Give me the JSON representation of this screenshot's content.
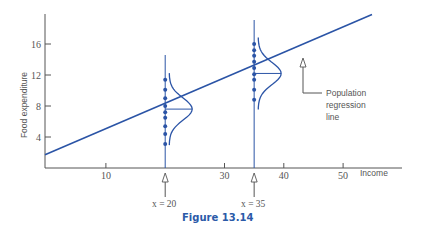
{
  "chart_data": {
    "type": "scatter",
    "title": "",
    "caption": "Figure 13.14",
    "xlabel": "Income",
    "ylabel": "Food expenditure",
    "xlim": [
      0,
      55
    ],
    "ylim": [
      0,
      18
    ],
    "x_ticks": [
      10,
      30,
      40,
      50
    ],
    "y_ticks": [
      4,
      8,
      12,
      16
    ],
    "grid": false,
    "regression_line": {
      "intercept": 1.7,
      "slope": 0.33,
      "x_range": [
        0,
        55
      ],
      "label": "Population regression line"
    },
    "series": [
      {
        "name": "x = 20",
        "x": 20,
        "y": [
          11.4,
          10.1,
          9.0,
          8.0,
          7.2,
          6.5,
          5.4,
          4.4,
          3.1
        ],
        "mean": 7.6
      },
      {
        "name": "x = 35",
        "x": 35,
        "y": [
          16.0,
          15.2,
          14.5,
          13.7,
          12.9,
          12.1,
          11.4,
          10.1,
          8.8
        ],
        "mean": 12.2
      }
    ],
    "annotations": [
      {
        "text": "Population regression line",
        "points_to": [
          43,
          15.7
        ]
      },
      {
        "text": "x = 20",
        "points_to": [
          20,
          0
        ]
      },
      {
        "text": "x = 35",
        "points_to": [
          35,
          0
        ]
      }
    ]
  },
  "labels": {
    "ylabel": "Food expenditure",
    "xlabel": "Income",
    "annot_line1": "Population",
    "annot_line2": "regression",
    "annot_line3": "line",
    "x20": "x = 20",
    "x35": "x = 35",
    "caption": "Figure 13.14"
  },
  "colors": {
    "line": "#2b54a6",
    "axis": "#555555",
    "caption": "#2b5aa8"
  }
}
